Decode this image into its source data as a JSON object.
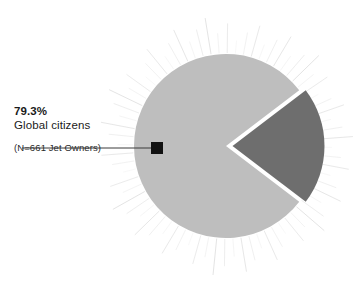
{
  "figure": {
    "background_color": "#ffffff",
    "width": 355,
    "height": 283
  },
  "callout": {
    "value": "79.3%",
    "label": "Global citizens",
    "note": "(N=661 Jet Owners)",
    "marker_color": "#111111",
    "leader_line_color": "#3a3a3a"
  },
  "chart_data": {
    "type": "pie",
    "title": "",
    "subtitle": "",
    "xlabel": "",
    "ylabel": "",
    "legend_position": "callout-left",
    "grid": false,
    "total_n": 661,
    "units": "percent",
    "categories": [
      "Global citizens",
      "Not global citizens"
    ],
    "values": [
      79.3,
      20.7
    ],
    "labels": [
      "79.3%",
      "20.7%"
    ],
    "colors": [
      "#bebebe",
      "#6e6e6e"
    ],
    "exploded": [
      false,
      true
    ],
    "annotations": [
      "79.3%",
      "Global citizens",
      "(N=661 Jet Owners)"
    ],
    "series": [
      {
        "name": "Jet Owners",
        "values": [
          79.3,
          20.7
        ]
      }
    ],
    "slices": [
      {
        "name": "Global citizens",
        "value": 79.3,
        "color": "#bebebe",
        "start_angle": 37.26,
        "end_angle": 322.74,
        "exploded": false,
        "labeled": true
      },
      {
        "name": "Not global citizens",
        "value": 20.7,
        "color": "#6e6e6e",
        "start_angle": -37.26,
        "end_angle": 37.26,
        "exploded": true,
        "labeled": false
      }
    ],
    "decoration": {
      "style": "sunburst-rays",
      "ray_color": "#d8d8d8",
      "ray_count": 72
    }
  }
}
